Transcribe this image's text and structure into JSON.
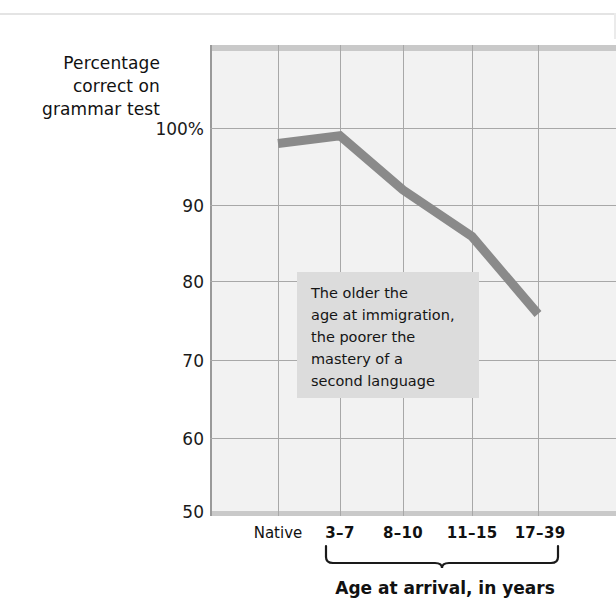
{
  "chart_data": {
    "type": "line",
    "title": "",
    "subtitle": "",
    "xlabel": "Age at arrival, in years",
    "ylabel": "Percentage correct on grammar test",
    "ylabel_lines": [
      "Percentage",
      "correct on",
      "grammar test"
    ],
    "categories": [
      "Native",
      "3–7",
      "8–10",
      "11–15",
      "17–39"
    ],
    "values": [
      98,
      99,
      92,
      86,
      76
    ],
    "series": [
      {
        "name": "Percentage correct on grammar test",
        "values": [
          98,
          99,
          92,
          86,
          76
        ]
      }
    ],
    "ylim": [
      50,
      108
    ],
    "yticks": [
      50,
      60,
      70,
      80,
      90,
      100
    ],
    "ytick_labels": [
      "50",
      "60",
      "70",
      "80",
      "90",
      "100%"
    ],
    "grid": true,
    "legend": "none",
    "line_color": "#8a8a8a",
    "plot_background": "#f2f2f2",
    "grid_color": "#a8a8a8",
    "annotation": {
      "text": "The older the\nage at immigration,\nthe poorer the\nmastery of a\nsecond language",
      "lines": [
        "The older the",
        "age at immigration,",
        "the poorer the",
        "mastery of a",
        "second language"
      ],
      "background": "#dcdcdc"
    },
    "group_bracket": {
      "label": "Age at arrival, in years",
      "covers": [
        "3–7",
        "8–10",
        "11–15",
        "17–39"
      ]
    }
  },
  "axis": {
    "y_title_line1": "Percentage",
    "y_title_line2": "correct on",
    "y_title_line3": "grammar test",
    "y_ticks": {
      "t100": "100%",
      "t90": "90",
      "t80": "80",
      "t70": "70",
      "t60": "60",
      "t50": "50"
    },
    "x_ticks": {
      "native": "Native",
      "g1": "3–7",
      "g2": "8–10",
      "g3": "11–15",
      "g4": "17–39"
    },
    "x_title": "Age at arrival, in years"
  },
  "annotation": {
    "line1": "The older the",
    "line2": "age at immigration,",
    "line3": "the poorer the",
    "line4": "mastery of a",
    "line5": "second language"
  }
}
